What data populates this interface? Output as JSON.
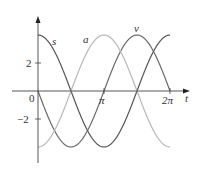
{
  "chart_data": {
    "type": "line",
    "title": "",
    "xlabel": "t",
    "ylabel": "",
    "xlim": [
      0,
      6.2832
    ],
    "ylim": [
      -4.5,
      5.5
    ],
    "x_ticks": [
      {
        "value": 3.1416,
        "label": "π"
      },
      {
        "value": 6.2832,
        "label": "2π"
      }
    ],
    "y_ticks": [
      {
        "value": 2,
        "label": "2"
      },
      {
        "value": -2,
        "label": "−2"
      }
    ],
    "origin_label": "0",
    "grid": false,
    "legend": "inline labels",
    "series": [
      {
        "name": "s",
        "formula": "4cos(t)",
        "color": "#555555",
        "x": [
          0,
          1.5708,
          3.1416,
          4.7124,
          6.2832
        ],
        "values": [
          4,
          0,
          -4,
          0,
          4
        ]
      },
      {
        "name": "v",
        "formula": "-4sin(t)",
        "color": "#6a6a6a",
        "x": [
          0,
          1.5708,
          3.1416,
          4.7124,
          6.2832
        ],
        "values": [
          0,
          -4,
          0,
          4,
          0
        ]
      },
      {
        "name": "a",
        "formula": "-4cos(t)",
        "color": "#b8b8b8",
        "x": [
          0,
          1.5708,
          3.1416,
          4.7124,
          6.2832
        ],
        "values": [
          -4,
          0,
          4,
          0,
          -4
        ]
      }
    ]
  },
  "labels": {
    "s": "s",
    "a": "a",
    "v": "v",
    "t": "t",
    "pi": "π",
    "two_pi": "2π",
    "y2": "2",
    "yneg2": "−2",
    "zero": "0"
  }
}
